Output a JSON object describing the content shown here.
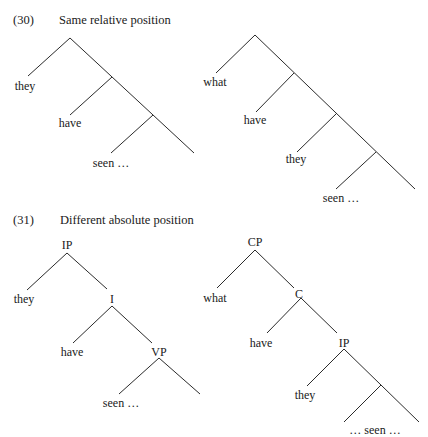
{
  "examples": [
    {
      "number": "(30)",
      "title": "Same relative position",
      "trees": [
        {
          "id": "tree-30a",
          "words": [
            "they",
            "have",
            "seen …"
          ],
          "node_labels": []
        },
        {
          "id": "tree-30b",
          "words": [
            "what",
            "have",
            "they",
            "seen …"
          ],
          "node_labels": []
        }
      ]
    },
    {
      "number": "(31)",
      "title": "Different absolute position",
      "trees": [
        {
          "id": "tree-31a",
          "words": [
            "they",
            "have",
            "seen …"
          ],
          "node_labels": [
            "IP",
            "I",
            "VP"
          ]
        },
        {
          "id": "tree-31b",
          "words": [
            "what",
            "have",
            "they",
            "… seen …"
          ],
          "node_labels": [
            "CP",
            "C",
            "IP"
          ]
        }
      ]
    }
  ],
  "colors": {
    "line": "#2b2b2b",
    "text": "#1a1a1a",
    "background": "#ffffff"
  }
}
